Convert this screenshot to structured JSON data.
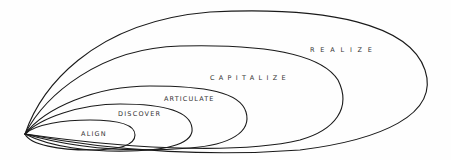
{
  "diagram": {
    "type": "nested-expanding-loops",
    "stroke_color": "#1a1a1a",
    "background": "#fefefe",
    "stages": [
      {
        "label": "ALIGN",
        "order": 1
      },
      {
        "label": "DISCOVER",
        "order": 2
      },
      {
        "label": "ARTICULATE",
        "order": 3
      },
      {
        "label": "CAPITALIZE",
        "order": 4
      },
      {
        "label": "REALIZE",
        "order": 5
      }
    ]
  }
}
